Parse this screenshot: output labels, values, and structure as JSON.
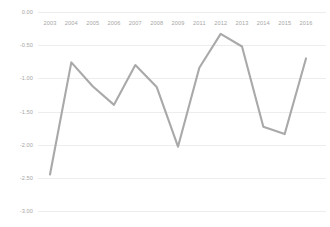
{
  "chart_data": {
    "type": "line",
    "title": "",
    "subtitle": "",
    "xlabel": "",
    "ylabel": "",
    "categories": [
      "2003",
      "2004",
      "2005",
      "2006",
      "2007",
      "2008",
      "2009",
      "2011",
      "2012",
      "2013",
      "2014",
      "2015",
      "2016"
    ],
    "x_tick_labels": [
      "2003",
      "2004",
      "2005",
      "2006",
      "2007",
      "2008",
      "2009",
      "2011",
      "2012",
      "2013",
      "2014",
      "2015",
      "2016"
    ],
    "y_tick_labels": [
      "0.00",
      "-0.50",
      "-1.00",
      "-1.50",
      "-2.00",
      "-2.50",
      "-3.00"
    ],
    "y_tick_values": [
      0.0,
      -0.5,
      -1.0,
      -1.5,
      -2.0,
      -2.5,
      -3.0
    ],
    "values": [
      -2.45,
      -0.76,
      -1.12,
      -1.4,
      -0.8,
      -1.13,
      -2.03,
      -0.84,
      -0.33,
      -0.52,
      -1.73,
      -1.84,
      -0.7
    ],
    "series": [
      {
        "name": "",
        "values": [
          -2.45,
          -0.76,
          -1.12,
          -1.4,
          -0.8,
          -1.13,
          -2.03,
          -0.84,
          -0.33,
          -0.52,
          -1.73,
          -1.84,
          -0.7
        ]
      }
    ],
    "ylim": [
      -3.0,
      0.0
    ],
    "grid": true,
    "grid_axis": "y",
    "legend": false,
    "legend_position": "none",
    "markers": false,
    "line_color": "#a9a9a9",
    "grid_color": "#eceded",
    "tick_label_color": "#a6a6a6",
    "background_color": "#ffffff",
    "annotations": []
  }
}
